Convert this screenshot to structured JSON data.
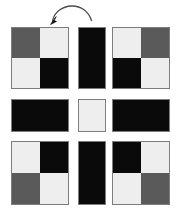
{
  "figure": {
    "background": "#ffffff",
    "arrow": {
      "icon": "curved-rotation-arrow",
      "direction": "counter-clockwise",
      "stroke": "#4d4d4d"
    },
    "palette": {
      "black": "#0a0a0a",
      "white": "#eeeeee",
      "gray": "#5a5a5a",
      "border": "#7d7d7d",
      "background": "#ffffff"
    },
    "grid": {
      "rows": 3,
      "columns": 3,
      "column_x": [
        11,
        78,
        112
      ],
      "column_w": [
        58,
        28,
        58
      ],
      "row_y": [
        27,
        99,
        141
      ],
      "row_h": [
        62,
        33,
        64
      ]
    },
    "tiles": [
      {
        "id": "tile-r1c1",
        "row": 1,
        "column": 1,
        "kind": "quad",
        "cells": [
          "gray",
          "white",
          "white",
          "black"
        ]
      },
      {
        "id": "tile-r1c2",
        "row": 1,
        "column": 2,
        "kind": "solid",
        "cells": [
          "black"
        ]
      },
      {
        "id": "tile-r1c3",
        "row": 1,
        "column": 3,
        "kind": "quad",
        "cells": [
          "white",
          "gray",
          "black",
          "white"
        ]
      },
      {
        "id": "tile-r2c1",
        "row": 2,
        "column": 1,
        "kind": "solid",
        "cells": [
          "black"
        ]
      },
      {
        "id": "tile-r2c2",
        "row": 2,
        "column": 2,
        "kind": "solid",
        "cells": [
          "white"
        ]
      },
      {
        "id": "tile-r2c3",
        "row": 2,
        "column": 3,
        "kind": "solid",
        "cells": [
          "black"
        ]
      },
      {
        "id": "tile-r3c1",
        "row": 3,
        "column": 1,
        "kind": "quad",
        "cells": [
          "white",
          "black",
          "gray",
          "white"
        ]
      },
      {
        "id": "tile-r3c2",
        "row": 3,
        "column": 2,
        "kind": "solid",
        "cells": [
          "black"
        ]
      },
      {
        "id": "tile-r3c3",
        "row": 3,
        "column": 3,
        "kind": "quad",
        "cells": [
          "black",
          "white",
          "white",
          "gray"
        ]
      }
    ]
  }
}
